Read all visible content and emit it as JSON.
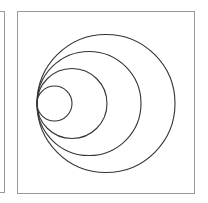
{
  "figure": {
    "box": {
      "x": 17,
      "y": 11,
      "width": 178,
      "height": 183,
      "border_color": "#999999"
    },
    "left_panel_edge": {
      "x": 5,
      "border_color": "#9a9a9a"
    },
    "circles": [
      {
        "name": "circle-smallest",
        "cx": 54.5,
        "cy": 103.5,
        "r": 17.5
      },
      {
        "name": "circle-second",
        "cx": 72,
        "cy": 103.5,
        "r": 35
      },
      {
        "name": "circle-third",
        "cx": 89,
        "cy": 103.5,
        "r": 52
      },
      {
        "name": "circle-largest",
        "cx": 106,
        "cy": 103.5,
        "r": 69
      }
    ],
    "tangent_point": {
      "x": 37,
      "y": 103.5
    },
    "stroke_color": "#333333"
  }
}
